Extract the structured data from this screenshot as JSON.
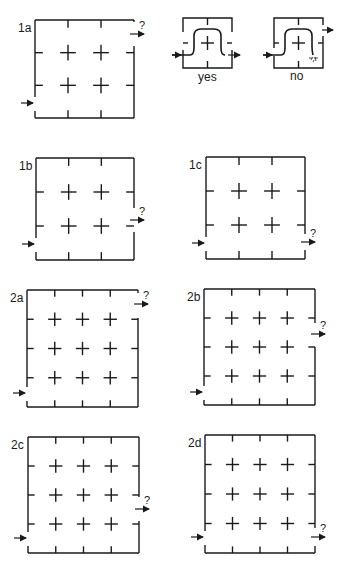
{
  "colors": {
    "ink": "#1a1a1a",
    "background": "#ffffff"
  },
  "puzzles": [
    {
      "id": "1a",
      "label": "1a",
      "question": "?",
      "box": {
        "x": 35,
        "y": 20,
        "w": 99,
        "h": 98
      },
      "n": 3,
      "entry_y": 103,
      "exit_y": 34,
      "exit_gap": [
        22,
        46
      ]
    },
    {
      "id": "1b",
      "label": "1b",
      "question": "?",
      "box": {
        "x": 36,
        "y": 158,
        "w": 98,
        "h": 102
      },
      "n": 3,
      "entry_y": 244,
      "exit_y": 220,
      "exit_gap": [
        208,
        232
      ]
    },
    {
      "id": "1c",
      "label": "1c",
      "question": "?",
      "box": {
        "x": 206,
        "y": 157,
        "w": 99,
        "h": 102
      },
      "n": 3,
      "entry_y": 243,
      "exit_y": 242,
      "exit_gap": [
        234,
        250
      ]
    },
    {
      "id": "2a",
      "label": "2a",
      "question": "?",
      "box": {
        "x": 27,
        "y": 290,
        "w": 111,
        "h": 117
      },
      "n": 4,
      "entry_y": 393,
      "exit_y": 304,
      "exit_gap": [
        293,
        318
      ]
    },
    {
      "id": "2b",
      "label": "2b",
      "question": "?",
      "box": {
        "x": 204,
        "y": 289,
        "w": 111,
        "h": 116
      },
      "n": 4,
      "entry_y": 392,
      "exit_y": 334,
      "exit_gap": [
        323,
        347
      ]
    },
    {
      "id": "2c",
      "label": "2c",
      "question": "?",
      "box": {
        "x": 28,
        "y": 437,
        "w": 111,
        "h": 116
      },
      "n": 4,
      "entry_y": 538,
      "exit_y": 509,
      "exit_gap": [
        497,
        521
      ]
    },
    {
      "id": "2d",
      "label": "2d",
      "question": "?",
      "box": {
        "x": 205,
        "y": 435,
        "w": 110,
        "h": 118
      },
      "n": 4,
      "entry_y": 537,
      "exit_y": 537,
      "exit_gap": [
        528,
        546
      ]
    }
  ],
  "examples": [
    {
      "id": "yes",
      "caption": "yes",
      "box": {
        "x": 183,
        "y": 18,
        "w": 49,
        "h": 50
      }
    },
    {
      "id": "no",
      "caption": "no",
      "box": {
        "x": 274,
        "y": 18,
        "w": 49,
        "h": 50
      }
    }
  ]
}
